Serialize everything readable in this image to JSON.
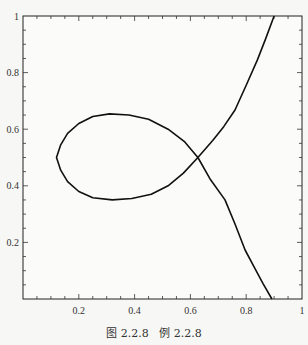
{
  "chart_data": {
    "type": "line",
    "title": "",
    "xlabel": "",
    "ylabel": "",
    "xlim": [
      0,
      1
    ],
    "ylim": [
      0,
      1
    ],
    "grid": false,
    "frame": true,
    "x_major_ticks": [
      0.2,
      0.4,
      0.6,
      0.8,
      1
    ],
    "x_tick_labels": [
      "0.2",
      "0.4",
      "0.6",
      "0.8",
      "1"
    ],
    "y_major_ticks": [
      0.2,
      0.4,
      0.6,
      0.8,
      1
    ],
    "y_tick_labels": [
      "0.2",
      "0.4",
      "0.6",
      "0.8",
      "1"
    ],
    "minor_tick_step": 0.05,
    "series": [
      {
        "name": "curve",
        "color": "#111111",
        "description": "Strophoid-like curve with a loop; self-intersection near (0.627, 0.5)",
        "points": [
          [
            0.9,
            1.0
          ],
          [
            0.87,
            0.92
          ],
          [
            0.84,
            0.845
          ],
          [
            0.8,
            0.755
          ],
          [
            0.76,
            0.668
          ],
          [
            0.72,
            0.61
          ],
          [
            0.68,
            0.56
          ],
          [
            0.627,
            0.5
          ],
          [
            0.58,
            0.555
          ],
          [
            0.52,
            0.6
          ],
          [
            0.45,
            0.635
          ],
          [
            0.38,
            0.65
          ],
          [
            0.31,
            0.654
          ],
          [
            0.25,
            0.645
          ],
          [
            0.2,
            0.62
          ],
          [
            0.16,
            0.585
          ],
          [
            0.135,
            0.545
          ],
          [
            0.12,
            0.5
          ],
          [
            0.135,
            0.455
          ],
          [
            0.16,
            0.415
          ],
          [
            0.2,
            0.38
          ],
          [
            0.25,
            0.358
          ],
          [
            0.32,
            0.35
          ],
          [
            0.39,
            0.355
          ],
          [
            0.46,
            0.37
          ],
          [
            0.52,
            0.4
          ],
          [
            0.575,
            0.445
          ],
          [
            0.627,
            0.5
          ],
          [
            0.67,
            0.425
          ],
          [
            0.724,
            0.35
          ],
          [
            0.76,
            0.265
          ],
          [
            0.796,
            0.173
          ],
          [
            0.83,
            0.11
          ],
          [
            0.86,
            0.055
          ],
          [
            0.892,
            0.0
          ]
        ]
      }
    ]
  },
  "caption": {
    "figure": "图 2.2.8",
    "example": "例 2.2.8"
  }
}
